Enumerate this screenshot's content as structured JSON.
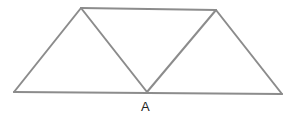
{
  "diagram": {
    "type": "geometry",
    "line_color": "#8c8c8c",
    "vertices": {
      "top_left": [
        81,
        8
      ],
      "top_right": [
        216,
        10
      ],
      "bottom_left": [
        14,
        92
      ],
      "A": [
        147,
        92
      ],
      "bottom_right": [
        282,
        94
      ]
    },
    "edges": [
      [
        "bottom_left",
        "top_left"
      ],
      [
        "top_left",
        "top_right"
      ],
      [
        "top_right",
        "bottom_right"
      ],
      [
        "bottom_left",
        "bottom_right"
      ],
      [
        "top_left",
        "A"
      ],
      [
        "A",
        "top_right"
      ]
    ],
    "labels": [
      {
        "text": "A",
        "x": 141,
        "y": 100
      }
    ]
  }
}
